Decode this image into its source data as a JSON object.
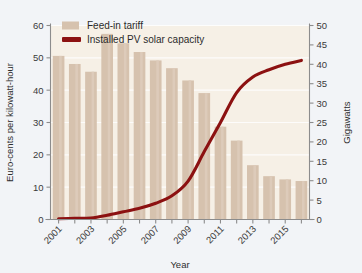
{
  "figure": {
    "background_color": "#f2f4f7",
    "plot_background_color": "#f6f0e6"
  },
  "legend": {
    "position": "top-left-inside",
    "items": [
      {
        "label": "Feed-in tariff",
        "marker": "bar-swatch",
        "color": "#d6c2ae"
      },
      {
        "label": "Installed PV solar capacity",
        "marker": "line-swatch",
        "color": "#8c1111"
      }
    ]
  },
  "axes": {
    "left": {
      "title": "Euro-cents per kilowatt-hour",
      "ticks": [
        "0",
        "10",
        "20",
        "30",
        "40",
        "50",
        "60"
      ],
      "min": 0,
      "max": 60
    },
    "right": {
      "title": "Gigawatts",
      "ticks": [
        "0",
        "5",
        "10",
        "15",
        "20",
        "25",
        "30",
        "35",
        "40",
        "45",
        "50"
      ],
      "min": 0,
      "max": 50
    },
    "bottom": {
      "title": "Year",
      "ticks": [
        "2001",
        "",
        "2003",
        "",
        "2005",
        "",
        "2007",
        "",
        "2009",
        "",
        "2011",
        "",
        "2013",
        "",
        "2015",
        ""
      ],
      "labels_shown": [
        "2001",
        "2003",
        "2005",
        "2007",
        "2009",
        "2011",
        "2013",
        "2015"
      ],
      "label_rotation": -45
    }
  },
  "chart_data": {
    "type": "bar",
    "title": "",
    "xlabel": "Year",
    "ylabel": "Euro-cents per kilowatt-hour",
    "y2label": "Gigawatts",
    "ylim": [
      0,
      60
    ],
    "y2lim": [
      0,
      50
    ],
    "grid": true,
    "legend_position": "top-left",
    "categories": [
      "2001",
      "2002",
      "2003",
      "2004",
      "2005",
      "2006",
      "2007",
      "2008",
      "2009",
      "2010",
      "2011",
      "2012",
      "2013",
      "2014",
      "2015",
      "2016"
    ],
    "series": [
      {
        "name": "Feed-in tariff",
        "type": "bar",
        "axis": "left",
        "unit": "Euro-cents per kilowatt-hour",
        "color": "#d6c2ae",
        "values": [
          50.6,
          48.1,
          45.7,
          57.4,
          54.5,
          51.8,
          49.2,
          46.8,
          43.0,
          39.1,
          28.7,
          24.4,
          16.8,
          13.4,
          12.4,
          11.9
        ]
      },
      {
        "name": "Installed PV solar capacity",
        "type": "line",
        "axis": "right",
        "unit": "Gigawatts",
        "color": "#8c1111",
        "values": [
          0.2,
          0.3,
          0.4,
          1.1,
          2.0,
          2.9,
          4.2,
          6.1,
          9.9,
          17.5,
          25.0,
          32.7,
          36.7,
          38.6,
          40.0,
          41.0
        ]
      }
    ]
  }
}
